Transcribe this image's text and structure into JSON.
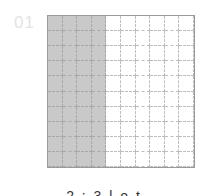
{
  "figure": {
    "label": "01",
    "caption": "2 : 3 l o t",
    "grid": {
      "rows": 10,
      "cols": 10,
      "shaded_cols": 4
    },
    "colors": {
      "shaded": "#c9c9c9",
      "border": "#9a9a9a",
      "label": "#e4e4e4"
    }
  }
}
